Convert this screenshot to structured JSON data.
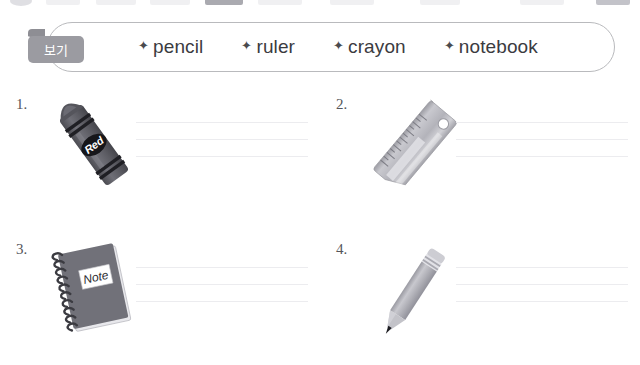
{
  "worksheet": {
    "wordbank": {
      "tag_label": "보기",
      "bullet": "sparkle",
      "words": [
        {
          "text": "pencil"
        },
        {
          "text": "ruler"
        },
        {
          "text": "crayon"
        },
        {
          "text": "notebook"
        }
      ]
    },
    "questions": [
      {
        "number": "1.",
        "image": "crayon",
        "image_label": "Red",
        "answer_lines": 3
      },
      {
        "number": "2.",
        "image": "ruler",
        "image_label": "",
        "answer_lines": 3
      },
      {
        "number": "3.",
        "image": "notebook",
        "image_label": "Note",
        "answer_lines": 3
      },
      {
        "number": "4.",
        "image": "pencil",
        "image_label": "",
        "answer_lines": 3
      }
    ]
  },
  "colors": {
    "page_background": "#ffffff",
    "border": "#b9babd",
    "text": "#3b3b3f",
    "tag_background": "#9b9ba1",
    "tag_text": "#ffffff",
    "line": "#ececef",
    "illustration_dark": "#4f4f55",
    "illustration_mid": "#8c8c93",
    "illustration_light": "#c4c4ca"
  }
}
